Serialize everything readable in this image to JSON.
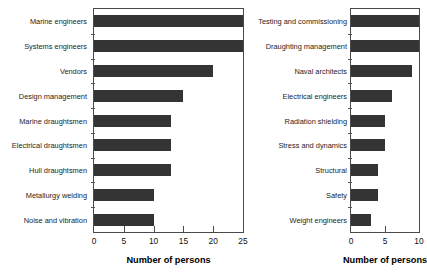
{
  "chart_data": [
    {
      "type": "bar",
      "orientation": "horizontal",
      "panel": "left",
      "title": "",
      "xlabel": "Number of persons",
      "ylabel": "",
      "xlim": [
        0,
        25
      ],
      "xticks": [
        0,
        5,
        10,
        15,
        20,
        25
      ],
      "xticklabels": [
        "0",
        "5",
        "10",
        "15",
        "20",
        "25"
      ],
      "grid": false,
      "legend": null,
      "bar_color": "#343434",
      "categories": [
        "Marine engineers",
        "Systems engineers",
        "Vendors",
        "Design management",
        "Marine draughtsmen",
        "Electrical draughtsmen",
        "Hull draughtsmen",
        "Metallurgy welding",
        "Noise and vibration"
      ],
      "values": [
        25,
        25,
        20,
        15,
        13,
        13,
        13,
        10,
        10
      ]
    },
    {
      "type": "bar",
      "orientation": "horizontal",
      "panel": "right",
      "title": "",
      "xlabel": "Number of persons",
      "ylabel": "",
      "xlim": [
        0,
        10
      ],
      "xticks": [
        0,
        5,
        10
      ],
      "xticklabels": [
        "0",
        "5",
        "10"
      ],
      "grid": false,
      "legend": null,
      "bar_color": "#343434",
      "categories": [
        "Testing and commissioning",
        "Draughting management",
        "Naval architects",
        "Electrical engineers",
        "Radiation shielding",
        "Stress and dynamics",
        "Structural",
        "Safety",
        "Weight engineers"
      ],
      "values": [
        10,
        10,
        9,
        6,
        5,
        5,
        4,
        4,
        3
      ]
    }
  ]
}
